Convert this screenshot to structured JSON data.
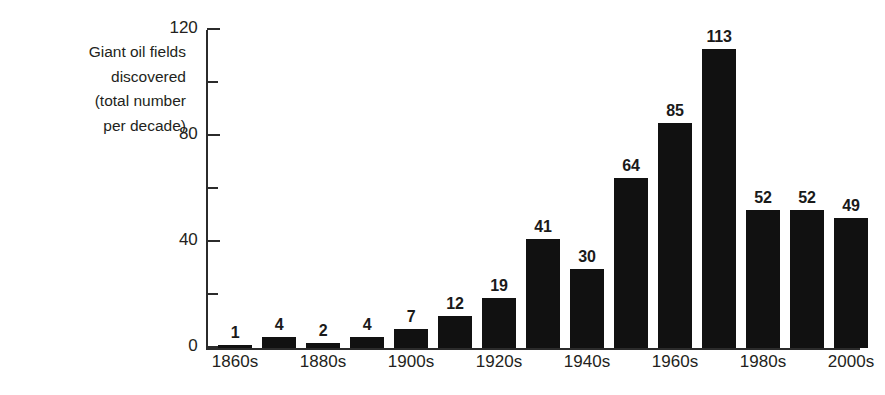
{
  "chart_data": {
    "type": "bar",
    "title": "",
    "subtitle": "",
    "ylabel_lines": [
      "Giant oil fields",
      "discovered",
      "(total number",
      "per decade)"
    ],
    "ylabel": "Giant oil fields discovered (total number per decade)",
    "xlabel": "",
    "categories": [
      "1860s",
      "1870s",
      "1880s",
      "1890s",
      "1900s",
      "1910s",
      "1920s",
      "1930s",
      "1940s",
      "1950s",
      "1960s",
      "1970s",
      "1980s",
      "1990s",
      "2000s"
    ],
    "values": [
      1,
      4,
      2,
      4,
      7,
      12,
      19,
      41,
      30,
      64,
      85,
      113,
      52,
      52,
      49
    ],
    "data_labels": [
      "1",
      "4",
      "2",
      "4",
      "7",
      "12",
      "19",
      "41",
      "30",
      "64",
      "85",
      "113",
      "52",
      "52",
      "49"
    ],
    "visible_xtick_labels": [
      "1860s",
      "",
      "1880s",
      "",
      "1900s",
      "",
      "1920s",
      "",
      "1940s",
      "",
      "1960s",
      "",
      "1980s",
      "",
      "2000s"
    ],
    "ylim": [
      0,
      120
    ],
    "ytick_values": [
      0,
      20,
      40,
      60,
      80,
      100,
      120
    ],
    "ytick_labels": [
      "0",
      "",
      "40",
      "",
      "80",
      "",
      "120"
    ],
    "grid": false,
    "legend": false,
    "legend_position": "none",
    "bar_color": "#111111",
    "axis_color": "#2b2b2b",
    "text_color": "#231f20",
    "background_color": "#ffffff"
  }
}
